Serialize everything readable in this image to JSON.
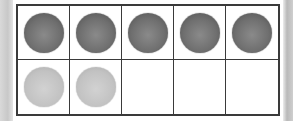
{
  "ten_frame": {
    "rows": 2,
    "columns": 5,
    "cells": [
      {
        "counter": "dark"
      },
      {
        "counter": "dark"
      },
      {
        "counter": "dark"
      },
      {
        "counter": "dark"
      },
      {
        "counter": "dark"
      },
      {
        "counter": "light"
      },
      {
        "counter": "light"
      },
      {
        "counter": "none"
      },
      {
        "counter": "none"
      },
      {
        "counter": "none"
      }
    ],
    "dark_count": 5,
    "light_count": 2,
    "total_counters": 7,
    "colors": {
      "dark": "#6f6f6f",
      "light": "#c4c4c4",
      "border": "#3a3a3a"
    }
  }
}
